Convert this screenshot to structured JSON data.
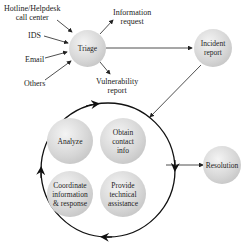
{
  "diagram": {
    "inputs": [
      {
        "id": "hotline",
        "label": "Hotline/Helpdesk\ncall center"
      },
      {
        "id": "ids",
        "label": "IDS"
      },
      {
        "id": "email",
        "label": "Email"
      },
      {
        "id": "others",
        "label": "Others"
      }
    ],
    "triage": {
      "label": "Triage"
    },
    "triage_outputs": [
      {
        "id": "info",
        "label": "Information\nrequest"
      },
      {
        "id": "vuln",
        "label": "Vulnerability\nreport"
      }
    ],
    "incident": {
      "label": "Incident\nreport"
    },
    "cycle": [
      {
        "id": "analyze",
        "label": "Analyze"
      },
      {
        "id": "obtain",
        "label": "Obtain\ncontact\ninfo"
      },
      {
        "id": "coordinate",
        "label": "Coordinate\ninformation\n& response"
      },
      {
        "id": "provide",
        "label": "Provide\ntechnical\nassistance"
      }
    ],
    "resolution": {
      "label": "Resolution"
    },
    "colors": {
      "node_fill": "#d6d6d6",
      "line": "#222222"
    }
  }
}
